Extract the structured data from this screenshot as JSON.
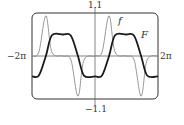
{
  "chart_data": {
    "type": "line",
    "title": "",
    "xlabel": "",
    "ylabel": "",
    "xlim": [
      "-2π",
      "2π"
    ],
    "xlim_numeric": [
      -6.2832,
      6.2832
    ],
    "ylim": [
      -1.1,
      1.1
    ],
    "grid": false,
    "tick_labels": {
      "x_left": "−2π",
      "x_right": "2π",
      "y_top": "1.1",
      "y_bottom": "−1.1"
    },
    "series": [
      {
        "name": "f",
        "style": "thin gray",
        "color": "#8a8a8a",
        "description": "sharp oscillating pulses, period 2π, peaks ≈ 1.03, troughs ≈ −1.03",
        "key_points": [
          {
            "x": -6.28,
            "y": 0.0
          },
          {
            "x": -5.6,
            "y": 0.1
          },
          {
            "x": -4.9,
            "y": 1.03
          },
          {
            "x": -4.3,
            "y": 0.1
          },
          {
            "x": -3.2,
            "y": 0.0
          },
          {
            "x": -2.4,
            "y": -0.1
          },
          {
            "x": -1.7,
            "y": -1.03
          },
          {
            "x": -1.1,
            "y": -0.1
          },
          {
            "x": 0.0,
            "y": 0.0
          },
          {
            "x": 0.7,
            "y": 0.1
          },
          {
            "x": 1.4,
            "y": 1.03
          },
          {
            "x": 2.0,
            "y": 0.1
          },
          {
            "x": 3.1,
            "y": 0.0
          },
          {
            "x": 3.9,
            "y": -0.1
          },
          {
            "x": 4.6,
            "y": -1.03
          },
          {
            "x": 5.2,
            "y": -0.1
          },
          {
            "x": 6.28,
            "y": 0.0
          }
        ]
      },
      {
        "name": "F",
        "style": "thick black",
        "color": "#1a1a1a",
        "description": "smoothed square wave (antiderivative of f), plateaus ≈ +0.55 and −0.52",
        "key_points": [
          {
            "x": -6.28,
            "y": -0.52
          },
          {
            "x": -5.6,
            "y": -0.5
          },
          {
            "x": -4.9,
            "y": 0.0
          },
          {
            "x": -4.3,
            "y": 0.53
          },
          {
            "x": -3.2,
            "y": 0.55
          },
          {
            "x": -2.4,
            "y": 0.52
          },
          {
            "x": -1.7,
            "y": 0.0
          },
          {
            "x": -1.1,
            "y": -0.5
          },
          {
            "x": 0.0,
            "y": -0.52
          },
          {
            "x": 0.7,
            "y": -0.5
          },
          {
            "x": 1.4,
            "y": 0.0
          },
          {
            "x": 2.0,
            "y": 0.53
          },
          {
            "x": 3.1,
            "y": 0.55
          },
          {
            "x": 3.9,
            "y": 0.52
          },
          {
            "x": 4.6,
            "y": 0.0
          },
          {
            "x": 5.2,
            "y": -0.5
          },
          {
            "x": 6.28,
            "y": -0.52
          }
        ]
      }
    ],
    "annotations": [
      {
        "text": "f",
        "near": "peak of f at x≈1.4"
      },
      {
        "text": "F",
        "near": "F plateau at x≈3"
      }
    ]
  },
  "labels": {
    "y_top": "1.1",
    "y_bottom": "−1.1",
    "x_left": "−2π",
    "x_right": "2π",
    "curve_f": "f",
    "curve_F": "F"
  }
}
